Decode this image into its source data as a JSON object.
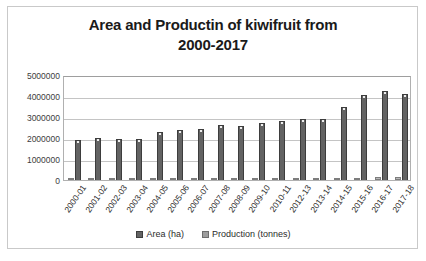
{
  "chart_data": {
    "type": "bar",
    "title": "Area and Productin of kiwifruit from 2000-2017",
    "title_line1": "Area and Productin of kiwifruit from",
    "title_line2": "2000-2017",
    "xlabel": "",
    "ylabel": "",
    "ylim": [
      0,
      5000000
    ],
    "ytick_labels": [
      "5000000",
      "4000000",
      "3000000",
      "2000000",
      "1000000",
      "0"
    ],
    "ytick_values": [
      5000000,
      4000000,
      3000000,
      2000000,
      1000000,
      0
    ],
    "grid": true,
    "legend_position": "bottom",
    "categories": [
      "2000-01",
      "2001-02",
      "2002-03",
      "2003-04",
      "2004-05",
      "2005-06",
      "2006-07",
      "2007-08",
      "2008-09",
      "2009-10",
      "2010-11",
      "2012-13",
      "2013-14",
      "2014-15",
      "2015-16",
      "2016-17",
      "2017-18"
    ],
    "series": [
      {
        "name": "Area (ha)",
        "color": "#636363",
        "values": [
          52000,
          55000,
          58000,
          60000,
          64000,
          68000,
          70000,
          73000,
          76000,
          80000,
          85000,
          92000,
          100000,
          110000,
          118000,
          125000,
          130000
        ]
      },
      {
        "name": "Production (tonnes)",
        "color": "#9e9e9e",
        "values": [
          1900000,
          1980000,
          1960000,
          1930000,
          2300000,
          2400000,
          2450000,
          2600000,
          2550000,
          2700000,
          2800000,
          2900000,
          2900000,
          3500000,
          4050000,
          4250000,
          4100000
        ]
      }
    ]
  },
  "legend": {
    "items": [
      {
        "label": "Area (ha)"
      },
      {
        "label": "Production (tonnes)"
      }
    ]
  }
}
